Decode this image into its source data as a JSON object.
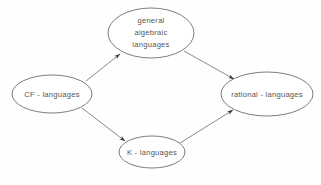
{
  "diagram": {
    "type": "directed-graph",
    "background_color": "#fefefe",
    "stroke_color": "#6d6d6d",
    "text_color": "#555555",
    "arrowhead_color": "#3a3a3a",
    "nodes": [
      {
        "id": "general-algebraic-languages",
        "shape": "ellipse",
        "lines": [
          "general",
          "algebraic",
          "languages"
        ],
        "line1": "general",
        "line2": "algebraic",
        "line3": "languages",
        "cx": 151,
        "cy": 33,
        "rx": 43,
        "ry": 25
      },
      {
        "id": "cf-languages",
        "shape": "ellipse",
        "lines": [
          "CF - languages"
        ],
        "line1": "CF - languages",
        "cx": 52,
        "cy": 94,
        "rx": 40,
        "ry": 19
      },
      {
        "id": "rational-languages",
        "shape": "ellipse",
        "lines": [
          "rational - languages"
        ],
        "line1": "rational - languages",
        "cx": 267,
        "cy": 94,
        "rx": 46,
        "ry": 22
      },
      {
        "id": "k-languages",
        "shape": "ellipse",
        "lines": [
          "K - languages"
        ],
        "line1": "K - languages",
        "cx": 152,
        "cy": 152,
        "rx": 33,
        "ry": 16
      }
    ],
    "edges": [
      {
        "id": "cf-to-general",
        "from": "cf-languages",
        "to": "general-algebraic-languages",
        "x1": 86,
        "y1": 81,
        "x2": 120,
        "y2": 54,
        "directed": true
      },
      {
        "id": "general-to-rational",
        "from": "general-algebraic-languages",
        "to": "rational-languages",
        "x1": 184,
        "y1": 51,
        "x2": 234,
        "y2": 79,
        "directed": true
      },
      {
        "id": "cf-to-k",
        "from": "cf-languages",
        "to": "k-languages",
        "x1": 82,
        "y1": 108,
        "x2": 125,
        "y2": 141,
        "directed": true
      },
      {
        "id": "k-to-rational",
        "from": "k-languages",
        "to": "rational-languages",
        "x1": 180,
        "y1": 143,
        "x2": 233,
        "y2": 110,
        "directed": true
      }
    ]
  }
}
